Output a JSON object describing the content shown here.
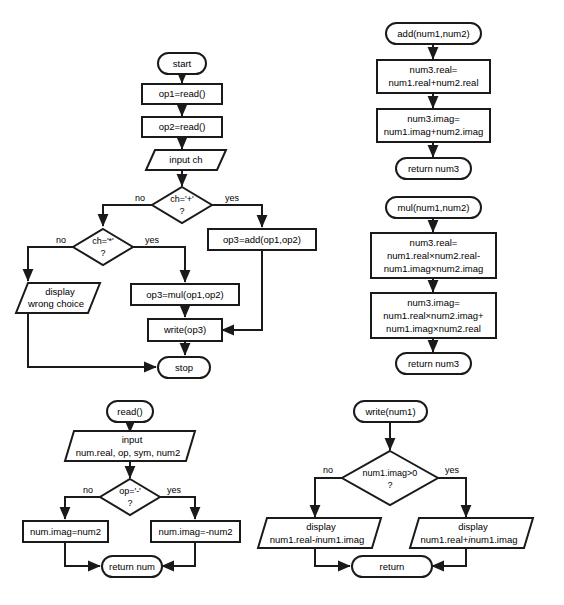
{
  "diagram": {
    "type": "flowchart",
    "colors": {
      "background": "#ffffff",
      "shape_fill": "#ffffff",
      "stroke": "#1a1a1a",
      "text": "#000000"
    },
    "charts": [
      {
        "id": "main",
        "name": "main-program-flowchart",
        "nodes": [
          {
            "id": "m1",
            "shape": "terminator",
            "text": "start"
          },
          {
            "id": "m2",
            "shape": "process",
            "text": "op1=read()"
          },
          {
            "id": "m3",
            "shape": "process",
            "text": "op2=read()"
          },
          {
            "id": "m4",
            "shape": "io",
            "text": "input ch"
          },
          {
            "id": "m5",
            "shape": "decision",
            "text": "ch='+'",
            "text2": "?"
          },
          {
            "id": "m6",
            "shape": "decision",
            "text": "ch='*'",
            "text2": "?"
          },
          {
            "id": "m7",
            "shape": "process",
            "text": "op3=add(op1,op2)"
          },
          {
            "id": "m8",
            "shape": "process",
            "text": "op3=mul(op1,op2)"
          },
          {
            "id": "m9",
            "shape": "io",
            "text": "display",
            "text2": "wrong choice"
          },
          {
            "id": "m10",
            "shape": "process",
            "text": "write(op3)"
          },
          {
            "id": "m11",
            "shape": "terminator",
            "text": "stop"
          }
        ],
        "edge_labels": [
          {
            "id": "m_l1",
            "text": "no"
          },
          {
            "id": "m_l2",
            "text": "yes"
          },
          {
            "id": "m_l3",
            "text": "no"
          },
          {
            "id": "m_l4",
            "text": "yes"
          }
        ]
      },
      {
        "id": "add",
        "name": "add-function-flowchart",
        "nodes": [
          {
            "id": "a1",
            "shape": "terminator",
            "text": "add(num1,num2)"
          },
          {
            "id": "a2",
            "shape": "process",
            "text": "num3.real=",
            "text2": "num1.real+num2.real"
          },
          {
            "id": "a3",
            "shape": "process",
            "text": "num3.imag=",
            "text2": "num1.imag+num2.imag"
          },
          {
            "id": "a4",
            "shape": "terminator",
            "text": "return num3"
          }
        ]
      },
      {
        "id": "mul",
        "name": "mul-function-flowchart",
        "nodes": [
          {
            "id": "u1",
            "shape": "terminator",
            "text": "mul(num1,num2)"
          },
          {
            "id": "u2",
            "shape": "process",
            "text": "num3.real=",
            "text2": "num1.real×num2.real-",
            "text3": "num1.imag×num2.imag"
          },
          {
            "id": "u3",
            "shape": "process",
            "text": "num3.imag=",
            "text2": "num1.real×num2.imag+",
            "text3": "num1.imag×num2.real"
          },
          {
            "id": "u4",
            "shape": "terminator",
            "text": "return num3"
          }
        ]
      },
      {
        "id": "read",
        "name": "read-function-flowchart",
        "nodes": [
          {
            "id": "r1",
            "shape": "terminator",
            "text": "read()"
          },
          {
            "id": "r2",
            "shape": "io",
            "text": "input",
            "text2": "num.real, op, sym, num2"
          },
          {
            "id": "r3",
            "shape": "decision",
            "text": "op='-'",
            "text2": "?"
          },
          {
            "id": "r4",
            "shape": "process",
            "text": "num.imag=num2"
          },
          {
            "id": "r5",
            "shape": "process",
            "text": "num.imag=-num2"
          },
          {
            "id": "r6",
            "shape": "terminator",
            "text": "return num"
          }
        ],
        "edge_labels": [
          {
            "id": "r_l1",
            "text": "no"
          },
          {
            "id": "r_l2",
            "text": "yes"
          }
        ]
      },
      {
        "id": "write",
        "name": "write-function-flowchart",
        "nodes": [
          {
            "id": "w1",
            "shape": "terminator",
            "text": "write(num1)"
          },
          {
            "id": "w2",
            "shape": "decision",
            "text": "num1.imag>0",
            "text2": "?"
          },
          {
            "id": "w3",
            "shape": "io",
            "text": "display",
            "text2a": "num1.real-",
            "text2i": "i",
            "text2b": "num1.imag"
          },
          {
            "id": "w4",
            "shape": "io",
            "text": "display",
            "text2a": "num1.real+",
            "text2i": "i",
            "text2b": "num1.imag"
          },
          {
            "id": "w5",
            "shape": "terminator",
            "text": "return"
          }
        ],
        "edge_labels": [
          {
            "id": "w_l1",
            "text": "no"
          },
          {
            "id": "w_l2",
            "text": "yes"
          }
        ]
      }
    ]
  }
}
